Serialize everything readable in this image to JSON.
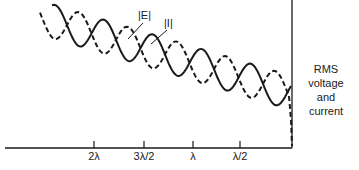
{
  "diagram": {
    "title": "",
    "axis": {
      "ticks": [
        {
          "label": "2λ",
          "x": 94
        },
        {
          "label": "3λ/2",
          "x": 144
        },
        {
          "label": "λ",
          "x": 193
        },
        {
          "label": "λ/2",
          "x": 240
        }
      ]
    },
    "curves": [
      {
        "name": "current",
        "label": "|I|",
        "style": "solid"
      },
      {
        "name": "voltage",
        "label": "|E|",
        "style": "dashed"
      }
    ],
    "side_label": {
      "line1": "RMS voltage",
      "line2": "and",
      "line3": "current"
    },
    "colors": {
      "ink": "#1a1a1a",
      "background": "#ffffff"
    }
  }
}
